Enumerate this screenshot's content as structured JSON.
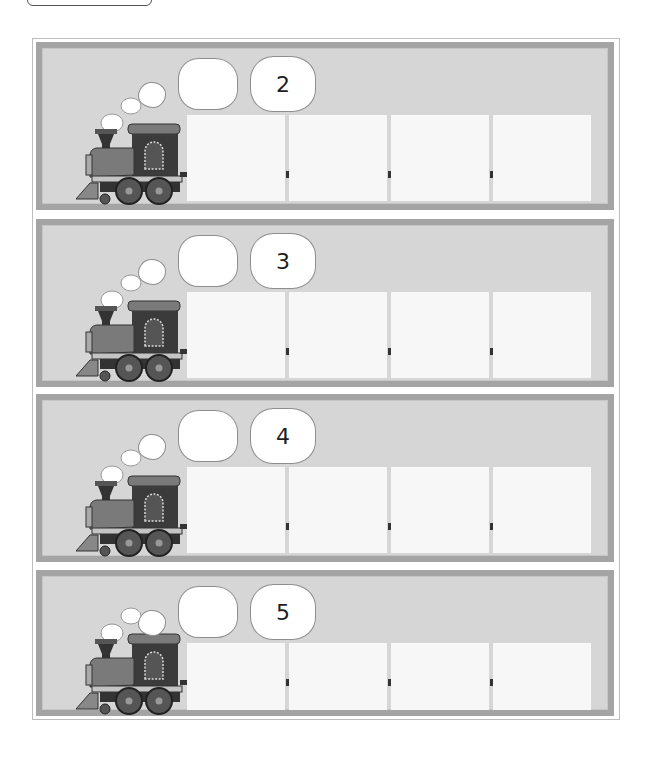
{
  "worksheet": {
    "rows": [
      {
        "number": "2",
        "blank_cloud": "",
        "boxes": [
          "",
          "",
          "",
          ""
        ]
      },
      {
        "number": "3",
        "blank_cloud": "",
        "boxes": [
          "",
          "",
          "",
          ""
        ]
      },
      {
        "number": "4",
        "blank_cloud": "",
        "boxes": [
          "",
          "",
          "",
          ""
        ]
      },
      {
        "number": "5",
        "blank_cloud": "",
        "boxes": [
          "",
          "",
          "",
          ""
        ]
      }
    ]
  },
  "colors": {
    "panel_border": "#a4a4a4",
    "panel_bg": "#d6d6d6",
    "box_bg": "#f7f7f7",
    "cloud_bg": "#ffffff"
  },
  "icons": {
    "train": "steam-locomotive-icon",
    "smoke": "smoke-cloud-icon"
  }
}
